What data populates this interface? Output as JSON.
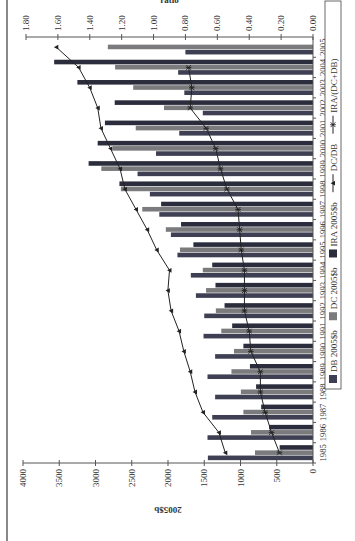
{
  "chart_data": {
    "type": "bar",
    "orientation_note": "page rotated 90deg counter-clockwise",
    "title": "",
    "xlabel": "",
    "ylabel": "2005$b",
    "y2label": "ratio",
    "ylim": [
      0,
      4000
    ],
    "y2lim": [
      0,
      1.8
    ],
    "yticks": [
      "0",
      "500",
      "1000",
      "1500",
      "2000",
      "2500",
      "3000",
      "3500",
      "4000"
    ],
    "y2ticks": [
      "0.00",
      "0.20",
      "0.40",
      "0.60",
      "0.80",
      "1.00",
      "1.20",
      "1.40",
      "1.60",
      "1.80"
    ],
    "grid": false,
    "legend_position": "bottom",
    "categories": [
      "1985",
      "1986",
      "1987",
      "1988",
      "1989",
      "1990",
      "1991",
      "1992",
      "1993",
      "1994",
      "1995",
      "1996",
      "1997",
      "1998",
      "1999",
      "2000",
      "2001",
      "2002",
      "2003",
      "2004",
      "2005"
    ],
    "series": [
      {
        "name": "DB 2005$b",
        "type": "bar",
        "axis": "left",
        "color": "#3e3f52",
        "values": [
          1450,
          1455,
          1390,
          1350,
          1455,
          1350,
          1510,
          1500,
          1615,
          1685,
          1870,
          1960,
          2120,
          2250,
          2420,
          2165,
          1845,
          1520,
          1775,
          1860,
          1760
        ]
      },
      {
        "name": "DC 2005$b",
        "type": "bar",
        "axis": "left",
        "color": "#7b7b7e",
        "values": [
          800,
          855,
          960,
          995,
          1125,
          1090,
          1265,
          1340,
          1475,
          1520,
          1835,
          2030,
          2355,
          2650,
          2920,
          2760,
          2445,
          2055,
          2480,
          2730,
          2830
        ]
      },
      {
        "name": "IRA 2005$b",
        "type": "bar",
        "axis": "left",
        "color": "#2c2d3c",
        "values": [
          460,
          605,
          715,
          785,
          870,
          960,
          1115,
          1220,
          1345,
          1390,
          1650,
          1820,
          2095,
          2670,
          3095,
          2970,
          2870,
          2735,
          3250,
          3570,
          null
        ]
      },
      {
        "name": "DC/DB",
        "type": "line",
        "axis": "right",
        "marker": "triangle",
        "color": "#222222",
        "values": [
          0.55,
          0.59,
          0.69,
          0.74,
          0.77,
          0.81,
          0.84,
          0.89,
          0.91,
          0.9,
          0.98,
          1.04,
          1.11,
          1.18,
          1.21,
          1.27,
          1.33,
          1.35,
          1.4,
          1.47,
          1.61
        ]
      },
      {
        "name": "IRA/(DC+DB)",
        "type": "line",
        "axis": "right",
        "marker": "star",
        "color": "#222222",
        "values": [
          0.21,
          0.26,
          0.3,
          0.33,
          0.33,
          0.39,
          0.4,
          0.43,
          0.43,
          0.43,
          0.45,
          0.46,
          0.47,
          0.54,
          0.58,
          0.61,
          0.67,
          0.77,
          0.76,
          0.78,
          null
        ]
      }
    ]
  },
  "legend": {
    "items": [
      {
        "label": "DB 2005$b",
        "kind": "swatch",
        "color": "#3e3f52"
      },
      {
        "label": "DC 2005$b",
        "kind": "swatch",
        "color": "#7b7b7e"
      },
      {
        "label": "IRA 2005$b",
        "kind": "swatch",
        "color": "#2c2d3c"
      },
      {
        "label": "DC/DB",
        "kind": "line-triangle",
        "color": "#222222"
      },
      {
        "label": "IRA/(DC+DB)",
        "kind": "line-star",
        "color": "#222222"
      }
    ]
  },
  "axes": {
    "left_label": "2005$b",
    "right_label": "ratio"
  }
}
